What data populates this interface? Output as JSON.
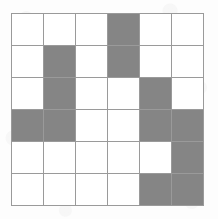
{
  "figure": {
    "name": "shaded-grid-pattern",
    "type": "grid",
    "rows": 6,
    "columns": 6,
    "origin_x": 11,
    "origin_y": 13,
    "width": 193,
    "height": 193,
    "colors": {
      "filled": "#858585",
      "empty": "#ffffff",
      "gridline": "#9a9a9a",
      "background": "#fdfdfd"
    },
    "line_width": 1,
    "filled_count": 12,
    "empty_count": 24,
    "cells": [
      [
        "empty",
        "empty",
        "empty",
        "filled",
        "empty",
        "empty"
      ],
      [
        "empty",
        "filled",
        "empty",
        "filled",
        "empty",
        "empty"
      ],
      [
        "empty",
        "filled",
        "empty",
        "empty",
        "filled",
        "empty"
      ],
      [
        "filled",
        "filled",
        "empty",
        "empty",
        "filled",
        "filled"
      ],
      [
        "empty",
        "empty",
        "empty",
        "empty",
        "empty",
        "filled"
      ],
      [
        "empty",
        "empty",
        "empty",
        "empty",
        "filled",
        "filled"
      ]
    ]
  }
}
